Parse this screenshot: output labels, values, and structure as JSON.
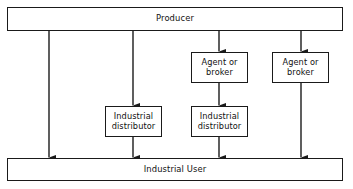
{
  "diagram": {
    "type": "flowchart",
    "canvas": {
      "width": 353,
      "height": 189
    },
    "style": {
      "background": "#ffffff",
      "line_color": "#1a1a1a",
      "box_border_color": "#1a1a1a",
      "box_fill": "#ffffff",
      "text_color": "#111111"
    },
    "nodes": [
      {
        "id": "producer",
        "label": "Producer",
        "shape": "rectangle",
        "x": 7,
        "y": 7,
        "width": 336,
        "height": 24
      },
      {
        "id": "agent_1",
        "label": "Agent or\nbroker",
        "shape": "rectangle",
        "x": 191,
        "y": 52,
        "width": 57,
        "height": 31
      },
      {
        "id": "agent_2",
        "label": "Agent or\nbroker",
        "shape": "rectangle",
        "x": 272,
        "y": 52,
        "width": 57,
        "height": 31
      },
      {
        "id": "distributor_1",
        "label": "Industrial\ndistributor",
        "shape": "rectangle",
        "x": 105,
        "y": 106,
        "width": 57,
        "height": 31
      },
      {
        "id": "distributor_2",
        "label": "Industrial\ndistributor",
        "shape": "rectangle",
        "x": 191,
        "y": 106,
        "width": 57,
        "height": 31
      },
      {
        "id": "user",
        "label": "Industrial User",
        "shape": "rectangle",
        "x": 7,
        "y": 158,
        "width": 336,
        "height": 23
      }
    ],
    "channels": [
      {
        "id": "channel-1-direct",
        "description": "Producer to Industrial User",
        "x": 49,
        "segments": [
          {
            "from": "producer",
            "to": "user",
            "x": 49,
            "y1": 31,
            "y2": 158,
            "arrow": true
          }
        ]
      },
      {
        "id": "channel-2-distributor",
        "description": "Producer to Industrial distributor to Industrial User",
        "x": 133,
        "segments": [
          {
            "from": "producer",
            "to": "distributor_1",
            "x": 133,
            "y1": 31,
            "y2": 106,
            "arrow": true
          },
          {
            "from": "distributor_1",
            "to": "user",
            "x": 133,
            "y1": 137,
            "y2": 158,
            "arrow": true
          }
        ]
      },
      {
        "id": "channel-3-agent-distributor",
        "description": "Producer to Agent or broker to Industrial distributor to Industrial User",
        "x": 219,
        "segments": [
          {
            "from": "producer",
            "to": "agent_1",
            "x": 219,
            "y1": 31,
            "y2": 52,
            "arrow": true
          },
          {
            "from": "agent_1",
            "to": "distributor_2",
            "x": 219,
            "y1": 83,
            "y2": 106,
            "arrow": true
          },
          {
            "from": "distributor_2",
            "to": "user",
            "x": 219,
            "y1": 137,
            "y2": 158,
            "arrow": true
          }
        ]
      },
      {
        "id": "channel-4-agent-direct",
        "description": "Producer to Agent or broker to Industrial User",
        "x": 301,
        "segments": [
          {
            "from": "producer",
            "to": "agent_2",
            "x": 301,
            "y1": 31,
            "y2": 52,
            "arrow": true
          },
          {
            "from": "agent_2",
            "to": "user",
            "x": 301,
            "y1": 83,
            "y2": 158,
            "arrow": true
          }
        ]
      }
    ],
    "arrow_marker": {
      "name": "arrowhead-icon",
      "width": 5.2,
      "height": 7.5
    }
  }
}
